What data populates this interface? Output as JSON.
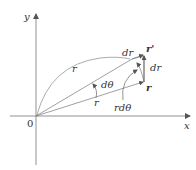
{
  "diagram": {
    "axes": {
      "x_label": "x",
      "y_label": "y",
      "origin_label": "0"
    },
    "labels": {
      "r_arc": "r",
      "r_inner": "r",
      "dtheta": "dθ",
      "dr_scalar": "dr",
      "r_vec": "r",
      "r_prime": "r'",
      "dr_vec": "dr",
      "r_dtheta": "rdθ"
    },
    "colors": {
      "lines": "#555555",
      "text": "#333333",
      "background": "#ffffff"
    }
  }
}
